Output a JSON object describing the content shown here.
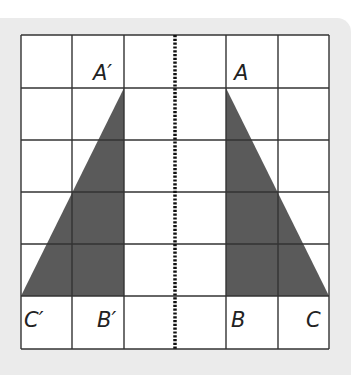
{
  "figure": {
    "type": "reflection-diagram",
    "grid": {
      "columns": 6,
      "rows": 6
    },
    "mirror_line": {
      "style": "dotted",
      "position": "vertical-center"
    },
    "colors": {
      "panel": "#ebebeb",
      "grid_line": "#333333",
      "fill": "#5a5a5a",
      "cell": "#ffffff"
    },
    "labels": {
      "A_prime": "A′",
      "B_prime": "B′",
      "C_prime": "C′",
      "A": "A",
      "B": "B",
      "C": "C"
    },
    "triangles": [
      {
        "name": "original",
        "vertices": {
          "A": [
            4,
            1
          ],
          "B": [
            4,
            5
          ],
          "C": [
            6,
            5
          ]
        }
      },
      {
        "name": "image",
        "vertices": {
          "A_prime": [
            2,
            1
          ],
          "B_prime": [
            2,
            5
          ],
          "C_prime": [
            0,
            5
          ]
        }
      }
    ]
  }
}
